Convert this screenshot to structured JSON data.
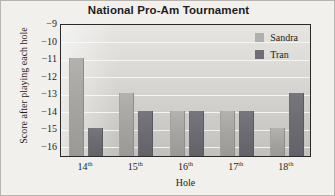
{
  "chart_data": {
    "type": "bar",
    "title": "National Pro-Am Tournament",
    "xlabel": "Hole",
    "ylabel": "Score after playing each hole",
    "categories": [
      "14th",
      "15th",
      "16th",
      "17th",
      "18th"
    ],
    "category_parts": [
      {
        "number": "14",
        "suffix": "th"
      },
      {
        "number": "15",
        "suffix": "th"
      },
      {
        "number": "16",
        "suffix": "th"
      },
      {
        "number": "17",
        "suffix": "th"
      },
      {
        "number": "18",
        "suffix": "th"
      }
    ],
    "series": [
      {
        "name": "Sandra",
        "color": "#b0afab",
        "values": [
          -11,
          -13,
          -14,
          -14,
          -15
        ]
      },
      {
        "name": "Tran",
        "color": "#6f6e74",
        "values": [
          -15,
          -14,
          -14,
          -14,
          -13
        ]
      }
    ],
    "ylim": [
      -16.6,
      -9
    ],
    "yticks": [
      -9,
      -10,
      -11,
      -12,
      -13,
      -14,
      -15,
      -16
    ],
    "ytick_labels": [
      "−9",
      "−10",
      "−11",
      "−12",
      "−13",
      "−14",
      "−15",
      "−16"
    ],
    "grid": true,
    "grid_axis": "y",
    "legend_position": "top-right-inside",
    "bar_baseline": -16.6,
    "plot_background": "#d8d7d3",
    "gridline_color": "#f6f5f3",
    "axis_border_color": "#2a2a2a",
    "canvas_background": "#f2f0ec"
  }
}
